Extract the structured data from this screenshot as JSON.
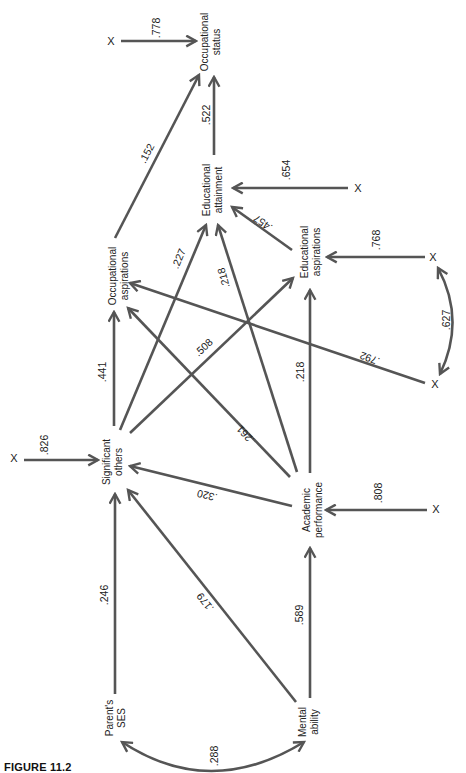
{
  "figure": {
    "caption": "FIGURE 11.2",
    "type": "path diagram",
    "colors": {
      "line": "#555555",
      "text": "#222222",
      "background": "#ffffff"
    }
  },
  "nodes": {
    "occupational_status": {
      "line1": "Occupational",
      "line2": "status"
    },
    "educational_attainment": {
      "line1": "Educational",
      "line2": "attainment"
    },
    "occupational_aspirations": {
      "line1": "Occupational",
      "line2": "aspirations"
    },
    "educational_aspirations": {
      "line1": "Educational",
      "line2": "aspirations"
    },
    "significant_others": {
      "line1": "Significant",
      "line2": "others"
    },
    "academic_performance": {
      "line1": "Academic",
      "line2": "performance"
    },
    "parents_ses": {
      "line1": "Parent's",
      "line2": "SES"
    },
    "mental_ability": {
      "line1": "Mental",
      "line2": "ability"
    }
  },
  "residual_marker": "X",
  "paths": [
    {
      "from": "X",
      "to": "Occupational status",
      "coef": ".778"
    },
    {
      "from": "Educational attainment",
      "to": "Occupational status",
      "coef": ".522"
    },
    {
      "from": "Occupational aspirations",
      "to": "Occupational status",
      "coef": ".152"
    },
    {
      "from": "X",
      "to": "Educational attainment",
      "coef": ".654"
    },
    {
      "from": "Educational aspirations",
      "to": "Educational attainment",
      "coef": ".457"
    },
    {
      "from": "Significant others",
      "to": "Educational attainment",
      "coef": ".227"
    },
    {
      "from": "Academic performance",
      "to": "Educational attainment",
      "coef": ".218"
    },
    {
      "from": "X",
      "to": "Educational aspirations",
      "coef": ".768"
    },
    {
      "from": "X",
      "to": "Occupational aspirations",
      "coef": ".792"
    },
    {
      "from": "X",
      "to": "X",
      "coef": ".627",
      "kind": "correlation"
    },
    {
      "from": "Significant others",
      "to": "Occupational aspirations",
      "coef": ".441"
    },
    {
      "from": "Significant others",
      "to": "Educational aspirations",
      "coef": ".508"
    },
    {
      "from": "Academic performance",
      "to": "Occupational aspirations",
      "coef": ".261"
    },
    {
      "from": "Academic performance",
      "to": "Educational aspirations",
      "coef": ".218"
    },
    {
      "from": "X",
      "to": "Significant others",
      "coef": ".826"
    },
    {
      "from": "Academic performance",
      "to": "Significant others",
      "coef": ".320"
    },
    {
      "from": "X",
      "to": "Academic performance",
      "coef": ".808"
    },
    {
      "from": "Parent's SES",
      "to": "Significant others",
      "coef": ".246"
    },
    {
      "from": "Mental ability",
      "to": "Significant others",
      "coef": ".179"
    },
    {
      "from": "Mental ability",
      "to": "Academic performance",
      "coef": ".589"
    },
    {
      "from": "Parent's SES",
      "to": "Mental ability",
      "coef": ".288",
      "kind": "correlation"
    }
  ],
  "labels": {
    "c778": ".778",
    "c522": ".522",
    "c152": ".152",
    "c654": ".654",
    "c457": ".457",
    "c227": ".227",
    "c218a": ".218",
    "c768": ".768",
    "c792": ".792",
    "c627": ".627",
    "c441": ".441",
    "c508": ".508",
    "c261": ".261",
    "c218b": ".218",
    "c826": ".826",
    "c320": ".320",
    "c808": ".808",
    "c246": ".246",
    "c179": ".179",
    "c589": ".589",
    "c288": ".288"
  }
}
